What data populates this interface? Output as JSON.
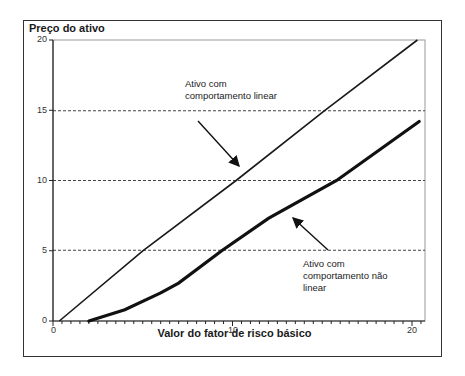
{
  "chart_data": {
    "type": "line",
    "title": "",
    "xlabel": "Valor do fator de risco básico",
    "ylabel": "Preço do ativo",
    "xlim": [
      0,
      20.7
    ],
    "ylim": [
      0,
      20
    ],
    "x_ticks": [
      "0",
      "10",
      "20"
    ],
    "y_ticks": [
      "0",
      "5",
      "10",
      "15",
      "20"
    ],
    "grid": "horizontal dashed at 5, 10, 15",
    "legend": "none (inline annotations)",
    "series": [
      {
        "name": "Ativo com comportamento linear",
        "x": [
          0.35,
          5.0,
          10.2,
          15.15,
          20.3
        ],
        "y": [
          0,
          5,
          10,
          15,
          20
        ]
      },
      {
        "name": "Ativo com comportamento não linear",
        "x": [
          2.0,
          4.0,
          6.0,
          7.0,
          9.4,
          12.0,
          15.8,
          20.4
        ],
        "y": [
          0,
          0.8,
          2.0,
          2.7,
          5.0,
          7.3,
          10.0,
          14.2
        ]
      }
    ],
    "annotations": [
      {
        "text_lines": [
          "Ativo com",
          "comportamento linear"
        ],
        "points_to": "linear series near x=10"
      },
      {
        "text_lines": [
          "Ativo com",
          "comportamento não",
          "linear"
        ],
        "points_to": "non-linear series near x=13"
      }
    ]
  }
}
